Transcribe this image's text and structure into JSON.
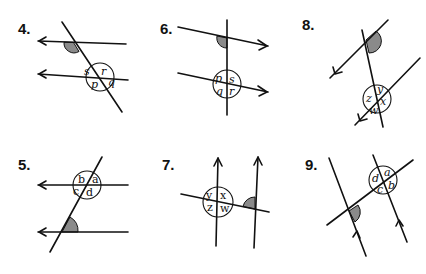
{
  "shade_color": "#8a8a8a",
  "problems": [
    {
      "number": "4.",
      "angle_labels": [
        "s",
        "r",
        "p",
        "q"
      ],
      "arrow_direction": "left"
    },
    {
      "number": "6.",
      "angle_labels": [
        "p",
        "s",
        "q",
        "r"
      ],
      "arrow_direction": "right"
    },
    {
      "number": "8.",
      "angle_labels": [
        "y",
        "z",
        "x",
        "w"
      ],
      "arrow_direction": "up-right"
    },
    {
      "number": "5.",
      "angle_labels": [
        "b",
        "a",
        "c",
        "d"
      ],
      "arrow_direction": "left"
    },
    {
      "number": "7.",
      "angle_labels": [
        "y",
        "x",
        "z",
        "w"
      ],
      "arrow_direction": "up"
    },
    {
      "number": "9.",
      "angle_labels": [
        "a",
        "d",
        "b",
        "c"
      ],
      "arrow_direction": "up"
    }
  ]
}
